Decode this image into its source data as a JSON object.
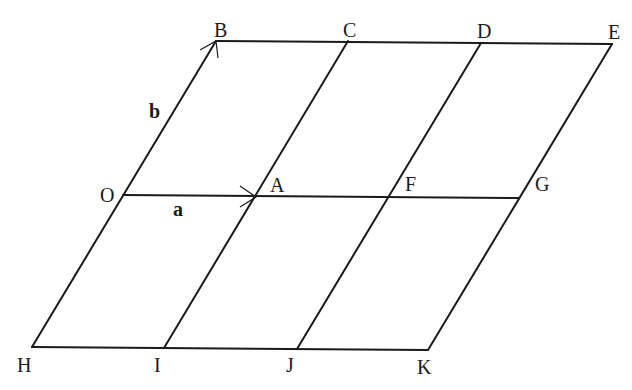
{
  "diagram": {
    "type": "parallelogram-grid",
    "points": {
      "B": {
        "label": "B",
        "x": 216,
        "y": 41
      },
      "C": {
        "label": "C",
        "x": 348,
        "y": 41
      },
      "D": {
        "label": "D",
        "x": 481,
        "y": 43
      },
      "E": {
        "label": "E",
        "x": 612,
        "y": 44
      },
      "O": {
        "label": "O",
        "x": 123,
        "y": 195
      },
      "A": {
        "label": "A",
        "x": 256,
        "y": 197
      },
      "F": {
        "label": "F",
        "x": 388,
        "y": 197
      },
      "G": {
        "label": "G",
        "x": 519,
        "y": 198
      },
      "H": {
        "label": "H",
        "x": 32,
        "y": 347
      },
      "I": {
        "label": "I",
        "x": 164,
        "y": 348
      },
      "J": {
        "label": "J",
        "x": 297,
        "y": 349
      },
      "K": {
        "label": "K",
        "x": 428,
        "y": 350
      }
    },
    "vectors": {
      "a": {
        "label": "a",
        "from": "O",
        "to": "A"
      },
      "b": {
        "label": "b",
        "from": "O",
        "to": "B"
      }
    },
    "segments": [
      [
        "B",
        "E"
      ],
      [
        "O",
        "G"
      ],
      [
        "H",
        "K"
      ],
      [
        "H",
        "B"
      ],
      [
        "I",
        "C"
      ],
      [
        "J",
        "D"
      ],
      [
        "K",
        "E"
      ]
    ],
    "line_color": "#1a1a1a"
  }
}
